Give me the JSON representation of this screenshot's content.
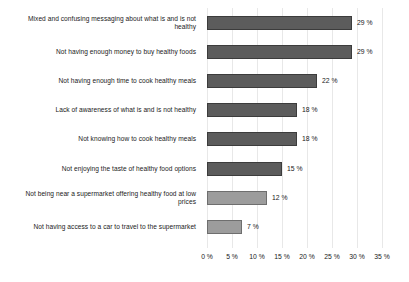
{
  "chart_data": {
    "type": "bar",
    "orientation": "horizontal",
    "title": "",
    "xlabel": "",
    "ylabel": "",
    "xlim": [
      0,
      35
    ],
    "grid": true,
    "legend": false,
    "tick_suffix": "%",
    "categories": [
      "Mixed and confusing messaging about what is and is not healthy",
      "Not having enough money to buy healthy foods",
      "Not having enough time to cook healthy meals",
      "Lack of awareness of what is and is not healthy",
      "Not knowing how to cook healthy meals",
      "Not enjoying the taste of healthy food options",
      "Not being near a supermarket offering healthy food at low prices",
      "Not having access to a car to travel to the supermarket"
    ],
    "values": [
      29,
      29,
      22,
      18,
      18,
      15,
      12,
      7
    ],
    "value_labels": [
      "29 %",
      "29 %",
      "22 %",
      "18 %",
      "18 %",
      "15 %",
      "12 %",
      "7 %"
    ],
    "bar_shades": [
      "dark",
      "dark",
      "dark",
      "dark",
      "dark",
      "dark",
      "light",
      "light"
    ],
    "xticks": [
      0,
      5,
      10,
      15,
      20,
      25,
      30,
      35
    ],
    "xtick_labels": [
      "0 %",
      "5 %",
      "10 %",
      "15 %",
      "20 %",
      "25 %",
      "30 %",
      "35 %"
    ],
    "colors": {
      "bar_dark": "#5c5c5c",
      "bar_light": "#9c9c9c",
      "bar_border": "#3c3c3c",
      "gridline": "#e8e8e8",
      "text": "#1a1a1a",
      "background": "#ffffff"
    }
  }
}
